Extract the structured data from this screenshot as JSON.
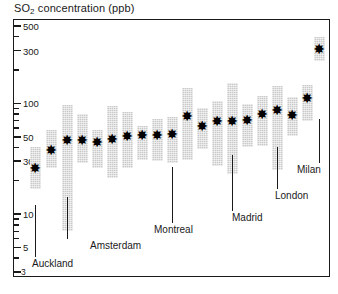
{
  "chart_data": {
    "type": "bar",
    "title": "SO2 concentration (ppb)",
    "title_html": "SO<sub>2</sub> concentration (ppb)",
    "xlabel": "",
    "ylabel": "SO2 concentration (ppb)",
    "yscale": "log",
    "ylim": [
      3,
      500
    ],
    "grid": false,
    "legend": null,
    "ytick_labels": [
      "500",
      "300",
      "100",
      "50",
      "30",
      "10",
      "5",
      "3"
    ],
    "ytick_values": [
      500,
      300,
      100,
      50,
      30,
      10,
      5,
      3
    ],
    "minor_ticks": [
      400,
      200,
      90,
      80,
      70,
      60,
      40,
      20,
      9,
      8,
      7,
      6,
      4
    ],
    "series_note": "Each city shown as an interquartile-range box with a star marking the median.",
    "categories": [
      "Auckland",
      "city-2",
      "Amsterdam",
      "city-4",
      "city-5",
      "city-6",
      "city-7",
      "city-8",
      "city-9",
      "Montreal",
      "city-11",
      "city-12",
      "city-13",
      "city-14",
      "Madrid",
      "city-16",
      "city-17",
      "London",
      "city-19",
      "Milan"
    ],
    "bars": [
      {
        "label": "Auckland",
        "x_px": 34,
        "low": 17,
        "high": 40,
        "median": 26
      },
      {
        "label": "",
        "x_px": 50,
        "low": 26,
        "high": 58,
        "median": 38
      },
      {
        "label": "Amsterdam",
        "x_px": 66,
        "low": 7,
        "high": 96,
        "median": 47
      },
      {
        "label": "",
        "x_px": 81,
        "low": 29,
        "high": 80,
        "median": 47
      },
      {
        "label": "",
        "x_px": 96,
        "low": 26,
        "high": 58,
        "median": 45
      },
      {
        "label": "",
        "x_px": 111,
        "low": 21,
        "high": 94,
        "median": 48
      },
      {
        "label": "",
        "x_px": 126,
        "low": 26,
        "high": 83,
        "median": 51
      },
      {
        "label": "",
        "x_px": 141,
        "low": 31,
        "high": 62,
        "median": 52
      },
      {
        "label": "",
        "x_px": 156,
        "low": 30,
        "high": 72,
        "median": 52
      },
      {
        "label": "Montreal",
        "x_px": 171,
        "low": 29,
        "high": 76,
        "median": 53
      },
      {
        "label": "",
        "x_px": 186,
        "low": 31,
        "high": 137,
        "median": 77
      },
      {
        "label": "",
        "x_px": 201,
        "low": 39,
        "high": 91,
        "median": 62
      },
      {
        "label": "",
        "x_px": 216,
        "low": 27,
        "high": 105,
        "median": 69
      },
      {
        "label": "",
        "x_px": 231,
        "low": 23,
        "high": 152,
        "median": 70
      },
      {
        "label": "Madrid",
        "x_px": 246,
        "low": 40,
        "high": 98,
        "median": 71
      },
      {
        "label": "",
        "x_px": 261,
        "low": 41,
        "high": 117,
        "median": 81
      },
      {
        "label": "",
        "x_px": 276,
        "low": 25,
        "high": 143,
        "median": 88
      },
      {
        "label": "London",
        "x_px": 291,
        "low": 51,
        "high": 114,
        "median": 79
      },
      {
        "label": "",
        "x_px": 306,
        "low": 70,
        "high": 146,
        "median": 113
      },
      {
        "label": "Milan",
        "x_px": 318,
        "low": 243,
        "high": 400,
        "median": 310
      }
    ],
    "annotations": [
      {
        "text": "Auckland",
        "leader_x_px": 34,
        "leader_top_px": 204,
        "leader_bottom_px": 256,
        "label_x_px": 31,
        "label_y_px": 257
      },
      {
        "text": "Amsterdam",
        "leader_x_px": 66,
        "leader_top_px": 196,
        "leader_bottom_px": 238,
        "label_x_px": 89,
        "label_y_px": 239
      },
      {
        "text": "Montreal",
        "leader_x_px": 171,
        "leader_top_px": 166,
        "leader_bottom_px": 222,
        "label_x_px": 153,
        "label_y_px": 223
      },
      {
        "text": "Madrid",
        "leader_x_px": 231,
        "leader_top_px": 154,
        "leader_bottom_px": 210,
        "label_x_px": 231,
        "label_y_px": 211
      },
      {
        "text": "London",
        "leader_x_px": 276,
        "leader_top_px": 146,
        "leader_bottom_px": 188,
        "label_x_px": 274,
        "label_y_px": 189
      },
      {
        "text": "Milan",
        "leader_x_px": 318,
        "leader_top_px": 118,
        "leader_bottom_px": 162,
        "label_x_px": 296,
        "label_y_px": 163
      }
    ],
    "marker_glyph": "✸",
    "colors": {
      "bar_fill": "#c9c9c9",
      "marker": "#000000",
      "axis": "#1a1a1a",
      "background": "#ffffff"
    }
  }
}
